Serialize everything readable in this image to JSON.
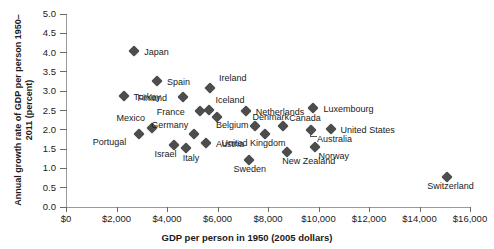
{
  "chart_data": {
    "type": "scatter",
    "title": "",
    "xlabel": "GDP per person in 1950 (2005 dollars)",
    "ylabel": "Annual growth rate of GDP per person 1950–2011 (percent)",
    "xlim": [
      0,
      16000
    ],
    "ylim": [
      0,
      5.0
    ],
    "xticks": [
      0,
      2000,
      4000,
      6000,
      8000,
      10000,
      12000,
      14000,
      16000
    ],
    "xtick_labels": [
      "$0",
      "$2,000",
      "$4,000",
      "$6,000",
      "$8,000",
      "$10,000",
      "$12,000",
      "$14,000",
      "$16,000"
    ],
    "yticks": [
      0.0,
      0.5,
      1.0,
      1.5,
      2.0,
      2.5,
      3.0,
      3.5,
      4.0,
      4.5,
      5.0
    ],
    "ytick_labels": [
      "0.0",
      "0.5",
      "1.0",
      "1.5",
      "2.0",
      "2.5",
      "3.0",
      "3.5",
      "4.0",
      "4.5",
      "5.0"
    ],
    "grid": false,
    "legend": false,
    "marker": "diamond",
    "marker_color": "#4d4d4d",
    "points": [
      {
        "name": "Japan",
        "x": 2700,
        "y": 4.05,
        "lx": 10,
        "ly": -4
      },
      {
        "name": "Spain",
        "x": 3600,
        "y": 3.27,
        "lx": 10,
        "ly": -4
      },
      {
        "name": "Turkey",
        "x": 2280,
        "y": 2.88,
        "lx": 10,
        "ly": -4
      },
      {
        "name": "Ireland",
        "x": 5700,
        "y": 3.07,
        "lx": 9,
        "ly": -15
      },
      {
        "name": "Finland",
        "x": 4650,
        "y": 2.86,
        "lx": -46,
        "ly": -4
      },
      {
        "name": "France",
        "x": 5300,
        "y": 2.5,
        "lx": -43,
        "ly": -4
      },
      {
        "name": "Iceland",
        "x": 5680,
        "y": 2.52,
        "lx": 6,
        "ly": -15
      },
      {
        "name": "Netherlands",
        "x": 7120,
        "y": 2.5,
        "lx": 10,
        "ly": -4
      },
      {
        "name": "Luxembourg",
        "x": 9800,
        "y": 2.57,
        "lx": 10,
        "ly": -4
      },
      {
        "name": "Belgium",
        "x": 5980,
        "y": 2.33,
        "lx": -1,
        "ly": 3
      },
      {
        "name": "Mexico",
        "x": 3390,
        "y": 2.04,
        "lx": -35,
        "ly": -15
      },
      {
        "name": "Germany",
        "x": 5080,
        "y": 1.88,
        "lx": -43,
        "ly": -14
      },
      {
        "name": "Denmark",
        "x": 7470,
        "y": 2.11,
        "lx": -2,
        "ly": -14
      },
      {
        "name": "Canada",
        "x": 8600,
        "y": 2.09,
        "lx": 6,
        "ly": -13
      },
      {
        "name": "United States",
        "x": 10480,
        "y": 2.02,
        "lx": 10,
        "ly": -4
      },
      {
        "name": "Australia",
        "x": 9700,
        "y": 2.0,
        "lx": 6,
        "ly": 4
      },
      {
        "name": "Austria",
        "x": 5540,
        "y": 1.65,
        "lx": 10,
        "ly": -4
      },
      {
        "name": "Portugal",
        "x": 2880,
        "y": 1.88,
        "lx": -46,
        "ly": 3
      },
      {
        "name": "Israel",
        "x": 4260,
        "y": 1.61,
        "lx": -19,
        "ly": 4
      },
      {
        "name": "Italy",
        "x": 4740,
        "y": 1.53,
        "lx": -3,
        "ly": 5
      },
      {
        "name": "United Kingdom",
        "x": 7900,
        "y": 1.88,
        "lx": -44,
        "ly": 4
      },
      {
        "name": "Norway",
        "x": 9880,
        "y": 1.55,
        "lx": 3,
        "ly": 4
      },
      {
        "name": "New Zealand",
        "x": 8760,
        "y": 1.42,
        "lx": -5,
        "ly": 4
      },
      {
        "name": "Sweden",
        "x": 7230,
        "y": 1.22,
        "lx": -15,
        "ly": 4
      },
      {
        "name": "Switzerland",
        "x": 15100,
        "y": 0.78,
        "lx": -20,
        "ly": 4
      }
    ]
  }
}
